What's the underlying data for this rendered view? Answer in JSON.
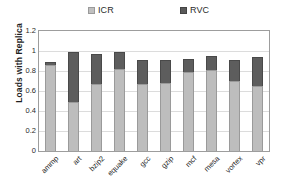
{
  "chart_data": {
    "type": "bar",
    "subtype": "stacked-bar",
    "title": "",
    "xlabel": "",
    "ylabel": "Loads with Replica",
    "ylim": [
      0,
      1.2
    ],
    "ytick_values": [
      0,
      0.2,
      0.4,
      0.6,
      0.8,
      1,
      1.2
    ],
    "ytick_labels": [
      "0",
      "0.2",
      "0.4",
      "0.6",
      "0.8",
      "1",
      "1.2"
    ],
    "grid": true,
    "grid_axis": "y",
    "legend_position": "top",
    "categories": [
      "ammp",
      "art",
      "bzip2",
      "equake",
      "gcc",
      "gzip",
      "mcf",
      "mesa",
      "vortex",
      "vpr"
    ],
    "series": [
      {
        "name": "ICR",
        "color": "#bdbdbd",
        "values": [
          0.86,
          0.49,
          0.67,
          0.82,
          0.67,
          0.68,
          0.79,
          0.81,
          0.7,
          0.65
        ]
      },
      {
        "name": "RVC",
        "color": "#5d5d5d",
        "values": [
          0.03,
          0.5,
          0.3,
          0.17,
          0.24,
          0.23,
          0.13,
          0.14,
          0.21,
          0.29
        ]
      }
    ],
    "totals": [
      0.89,
      0.99,
      0.97,
      0.99,
      0.91,
      0.91,
      0.92,
      0.95,
      0.91,
      0.94
    ]
  },
  "legend": {
    "entries": [
      {
        "label": "ICR",
        "color": "#bdbdbd"
      },
      {
        "label": "RVC",
        "color": "#5d5d5d"
      }
    ]
  },
  "colors": {
    "icr": "#bdbdbd",
    "rvc": "#5d5d5d",
    "axis": "#9d9d9d",
    "grid": "#dcdcdc",
    "text": "#1f1f1f",
    "background": "#ffffff"
  }
}
